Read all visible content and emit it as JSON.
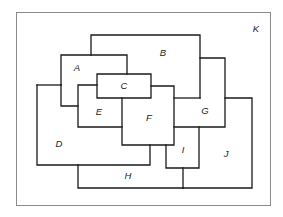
{
  "diagram": {
    "type": "planar-map-regions",
    "frame": {
      "label": "K",
      "x": 16,
      "y": 12,
      "w": 254,
      "h": 193
    },
    "regions": [
      {
        "id": "K",
        "label": "K",
        "label_pos": [
          256,
          32
        ]
      },
      {
        "id": "A",
        "label": "A",
        "label_pos": [
          77,
          71
        ]
      },
      {
        "id": "B",
        "label": "B",
        "label_pos": [
          163,
          56
        ]
      },
      {
        "id": "C",
        "label": "C",
        "label_pos": [
          124,
          89
        ]
      },
      {
        "id": "D",
        "label": "D",
        "label_pos": [
          59,
          147
        ]
      },
      {
        "id": "E",
        "label": "E",
        "label_pos": [
          99,
          115
        ]
      },
      {
        "id": "F",
        "label": "F",
        "label_pos": [
          149,
          121
        ]
      },
      {
        "id": "G",
        "label": "G",
        "label_pos": [
          205,
          114
        ]
      },
      {
        "id": "H",
        "label": "H",
        "label_pos": [
          128,
          179
        ]
      },
      {
        "id": "I",
        "label": "I",
        "label_pos": [
          183,
          153
        ]
      },
      {
        "id": "J",
        "label": "J",
        "label_pos": [
          226,
          157
        ]
      }
    ],
    "edges": [
      "M91 55 L91 35 L200 35 L200 98",
      "M61 85 L61 55 L127 55 L127 74",
      "M61 85 L61 106 L78 106",
      "M37 85 L61 85",
      "M37 85 L37 165 L150 165 L150 145",
      "M97 74 L151 74 L151 98 L97 98 Z",
      "M97 85 L78 85 L78 127 L122 127",
      "M122 98 L122 145 L174 145 L174 86 L151 86",
      "M174 98 L200 98",
      "M200 58 L225 58 L225 127 L174 127",
      "M225 98 L252 98 L252 188 L183 188",
      "M166 145 L166 168 L199 168 L199 127",
      "M183 168 L183 188",
      "M78 165 L78 188 L183 188"
    ]
  }
}
